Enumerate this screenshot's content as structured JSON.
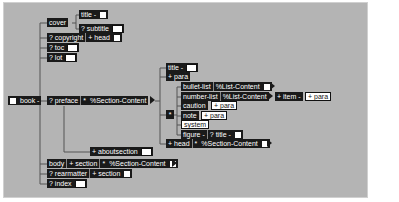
{
  "diagram": {
    "type": "xml-dtd-content-model-tree",
    "root": "book",
    "nodes": {
      "book": "book -",
      "cover": "cover",
      "title_cover": "title -",
      "subtitle": "? subtitle",
      "copyright": "? copyright",
      "head_copyright": "+ head",
      "toc": "? toc",
      "lot": "? lot",
      "preface": "? preface",
      "section_content_preface": "%Section-Content",
      "title_section": "title -",
      "para": "+ para",
      "bullet_list": "bullet-list",
      "list_content_1": "%List-Content",
      "number_list": "number-list",
      "list_content_2": "%List-Content",
      "item": "+ item -",
      "para_item": "+ para",
      "caution": "caution",
      "para_caution": "+ para",
      "note": "note",
      "para_note": "+ para",
      "system": "system",
      "figure": "figure -",
      "title_figure": "? title -",
      "head": "+ head",
      "section_content_head": "%Section-Content",
      "aboutsection": "+ aboutsection",
      "body": "body",
      "section_body": "+ section",
      "section_content_body": "%Section-Content",
      "rearmatter": "? rearmatter",
      "section_rear": "+ section",
      "index": "? index"
    },
    "choice_marker": "*",
    "colors": {
      "background": "#b4b4b4",
      "node": "#1a1a1a",
      "node_text": "#ffffff",
      "line": "#555555"
    }
  }
}
